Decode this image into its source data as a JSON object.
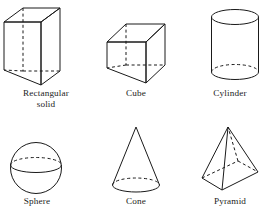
{
  "figure": {
    "background_color": "#ffffff",
    "stroke_color": "#1a1a1a",
    "hidden_edge_style": "dashed",
    "rows": 2,
    "columns": 3
  },
  "solids": [
    {
      "id": "rectangular-solid",
      "label": "Rectangular\nsolid",
      "label_lines": [
        "Rectangular",
        "solid"
      ],
      "row": 1,
      "column": 1,
      "shape": "rectangular prism"
    },
    {
      "id": "cube",
      "label": "Cube",
      "label_lines": [
        "Cube"
      ],
      "row": 1,
      "column": 2,
      "shape": "cube"
    },
    {
      "id": "cylinder",
      "label": "Cylinder",
      "label_lines": [
        "Cylinder"
      ],
      "row": 1,
      "column": 3,
      "shape": "cylinder"
    },
    {
      "id": "sphere",
      "label": "Sphere",
      "label_lines": [
        "Sphere"
      ],
      "row": 2,
      "column": 1,
      "shape": "sphere"
    },
    {
      "id": "cone",
      "label": "Cone",
      "label_lines": [
        "Cone"
      ],
      "row": 2,
      "column": 2,
      "shape": "cone"
    },
    {
      "id": "pyramid",
      "label": "Pyramid",
      "label_lines": [
        "Pyramid"
      ],
      "row": 2,
      "column": 3,
      "shape": "square pyramid"
    }
  ]
}
